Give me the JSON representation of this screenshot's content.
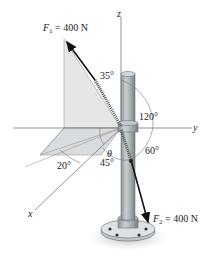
{
  "figure": {
    "type": "statics-force-diagram",
    "forces": [
      {
        "symbol": "F",
        "subscript": "1",
        "value_text": "= 400 N"
      },
      {
        "symbol": "F",
        "subscript": "2",
        "value_text": "= 400 N"
      }
    ],
    "axes": {
      "x": "x",
      "y": "y",
      "z": "z"
    },
    "angles": {
      "a35": "35°",
      "a120": "120°",
      "a60": "60°",
      "a45": "45°",
      "a20": "20°",
      "theta": "θ"
    },
    "colors": {
      "pole": "#a9b0b3",
      "pole_shadow": "#7d8589",
      "plane_fill": "#e4e6e8",
      "force_arrow": "#111111",
      "axis_line": "#666666"
    }
  }
}
